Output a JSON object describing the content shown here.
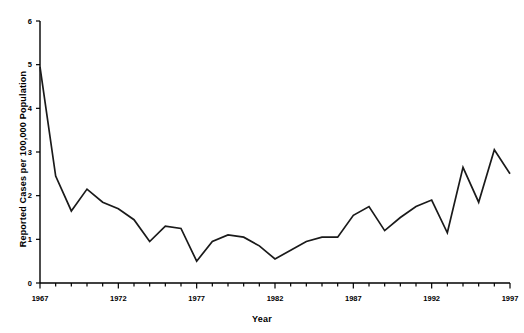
{
  "chart_data": {
    "type": "line",
    "title": "",
    "subtitle": "",
    "xlabel": "Year",
    "ylabel": "Reported Cases per 100,000 Population",
    "xlim": [
      1967,
      1997
    ],
    "ylim": [
      0,
      6
    ],
    "grid": false,
    "legend": null,
    "line_color": "#1a1a1a",
    "axis_color": "#000000",
    "background_color": "#ffffff",
    "xticks": [
      1967,
      1972,
      1977,
      1982,
      1987,
      1992,
      1997
    ],
    "xtick_labels": [
      "1967",
      "1972",
      "1977",
      "1982",
      "1987",
      "1992",
      "1997"
    ],
    "xtick_minor_step": 1,
    "yticks": [
      0,
      1,
      2,
      3,
      4,
      5,
      6
    ],
    "ytick_labels": [
      "0",
      "1",
      "2",
      "3",
      "4",
      "5",
      "6"
    ],
    "x": [
      1967,
      1968,
      1969,
      1970,
      1971,
      1972,
      1973,
      1974,
      1975,
      1976,
      1977,
      1978,
      1979,
      1980,
      1981,
      1982,
      1983,
      1984,
      1985,
      1986,
      1987,
      1988,
      1989,
      1990,
      1991,
      1992,
      1993,
      1994,
      1995,
      1996,
      1997
    ],
    "values": [
      4.95,
      2.45,
      1.65,
      2.15,
      1.85,
      1.7,
      1.45,
      0.95,
      1.3,
      1.25,
      0.5,
      0.95,
      1.1,
      1.05,
      0.85,
      0.55,
      0.75,
      0.95,
      1.05,
      1.05,
      1.55,
      1.75,
      1.2,
      1.5,
      1.75,
      1.9,
      1.15,
      2.65,
      1.85,
      3.05,
      2.5
    ],
    "series": [
      {
        "name": "Reported cases per 100,000 population",
        "values": [
          4.95,
          2.45,
          1.65,
          2.15,
          1.85,
          1.7,
          1.45,
          0.95,
          1.3,
          1.25,
          0.5,
          0.95,
          1.1,
          1.05,
          0.85,
          0.55,
          0.75,
          0.95,
          1.05,
          1.05,
          1.55,
          1.75,
          1.2,
          1.5,
          1.75,
          1.9,
          1.15,
          2.65,
          1.85,
          3.05,
          2.5
        ]
      }
    ]
  }
}
